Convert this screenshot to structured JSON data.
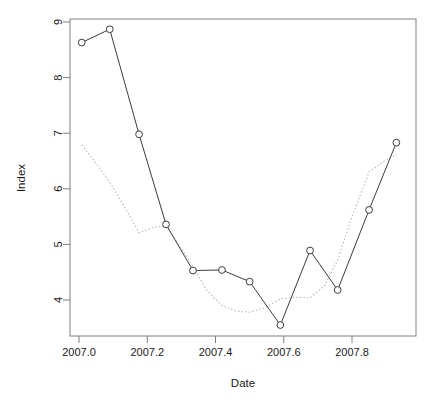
{
  "chart_data": {
    "type": "line",
    "title": "",
    "subtitle": "",
    "xlabel": "Date",
    "ylabel": "Index",
    "xlim": [
      2006.995,
      2007.94
    ],
    "ylim": [
      3.45,
      9.12
    ],
    "xticks": [
      2007.0,
      2007.2,
      2007.4,
      2007.6,
      2007.8
    ],
    "xtick_labels": [
      "2007.0",
      "2007.2",
      "2007.4",
      "2007.6",
      "2007.8"
    ],
    "yticks": [
      4,
      5,
      6,
      7,
      8,
      9
    ],
    "ytick_labels": [
      "4",
      "5",
      "6",
      "7",
      "8",
      "9"
    ],
    "grid": false,
    "legend": "none",
    "box": "full-rectangle",
    "series": [
      {
        "name": "observed",
        "style": "solid-with-open-circle-markers",
        "color": "#3c3c3c",
        "markers": true,
        "x": [
          2007.008,
          2007.09,
          2007.176,
          2007.255,
          2007.334,
          2007.419,
          2007.5,
          2007.59,
          2007.677,
          2007.758,
          2007.85,
          2007.93
        ],
        "y": [
          8.63,
          8.87,
          6.98,
          5.36,
          4.53,
          4.54,
          4.33,
          3.55,
          4.89,
          4.18,
          5.62,
          6.83
        ]
      },
      {
        "name": "fitted",
        "style": "dotted",
        "color": "#b4b4b4",
        "markers": false,
        "x": [
          2007.008,
          2007.05,
          2007.09,
          2007.135,
          2007.176,
          2007.215,
          2007.255,
          2007.3,
          2007.334,
          2007.375,
          2007.419,
          2007.46,
          2007.5,
          2007.545,
          2007.59,
          2007.635,
          2007.677,
          2007.72,
          2007.758,
          2007.8,
          2007.85,
          2007.89,
          2007.93
        ],
        "y": [
          6.79,
          6.46,
          6.12,
          5.66,
          5.21,
          5.3,
          5.34,
          4.93,
          4.6,
          4.17,
          3.9,
          3.8,
          3.78,
          3.86,
          4.02,
          4.05,
          4.04,
          4.26,
          4.72,
          5.5,
          6.3,
          6.48,
          6.62
        ]
      }
    ]
  },
  "axes": {
    "x_axis_title": "Date",
    "y_axis_title": "Index"
  }
}
